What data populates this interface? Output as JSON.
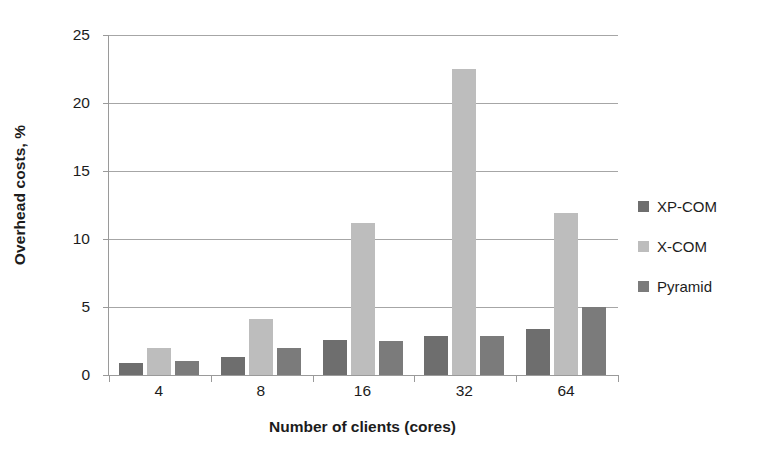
{
  "chart_data": {
    "type": "bar",
    "title": "",
    "subtitle": "",
    "xlabel": "Number of clients (cores)",
    "ylabel": "Overhead costs, %",
    "categories": [
      "4",
      "8",
      "16",
      "32",
      "64"
    ],
    "series": [
      {
        "name": "XP-COM",
        "color": "#6e6e6e",
        "values": [
          0.9,
          1.3,
          2.6,
          2.9,
          3.35
        ]
      },
      {
        "name": "X-COM",
        "color": "#bdbdbd",
        "values": [
          2.0,
          4.1,
          11.2,
          22.5,
          11.9
        ]
      },
      {
        "name": "Pyramid",
        "color": "#7b7b7b",
        "values": [
          1.0,
          2.0,
          2.5,
          2.9,
          5.0
        ]
      }
    ],
    "ylim": [
      0,
      25
    ],
    "ytick_values": [
      0,
      5,
      10,
      15,
      20,
      25
    ],
    "ytick_labels": [
      "0",
      "5",
      "10",
      "15",
      "20",
      "25"
    ],
    "grid": true,
    "grid_axis": "y",
    "legend_position": "right",
    "bar_orientation": "vertical",
    "grouping": "clustered"
  },
  "legend": {
    "items": [
      {
        "label": "XP-COM",
        "color": "#6e6e6e"
      },
      {
        "label": "X-COM",
        "color": "#bdbdbd"
      },
      {
        "label": "Pyramid",
        "color": "#7b7b7b"
      }
    ]
  },
  "axes": {
    "y_title": "Overhead costs, %",
    "x_title": "Number of clients (cores)"
  }
}
